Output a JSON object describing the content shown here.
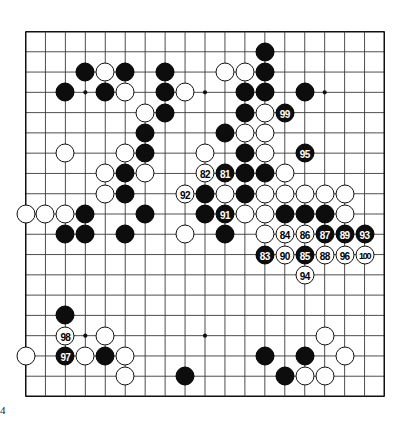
{
  "figure": {
    "kind": "go-board-diagram",
    "board_size": 19,
    "page_number": "4",
    "colors": {
      "black_stone": "#0d0d0d",
      "white_stone": "#ffffff",
      "grid_line": "#3a3a3a",
      "border": "#111111",
      "background": "#ffffff"
    },
    "star_points": [
      [
        4,
        4
      ],
      [
        10,
        4
      ],
      [
        16,
        4
      ],
      [
        4,
        10
      ],
      [
        10,
        10
      ],
      [
        16,
        10
      ],
      [
        4,
        16
      ],
      [
        10,
        16
      ],
      [
        16,
        16
      ]
    ]
  },
  "stones": [
    {
      "color": "black",
      "col": 13,
      "row": 2,
      "label": ""
    },
    {
      "color": "white",
      "col": 11,
      "row": 3,
      "label": ""
    },
    {
      "color": "white",
      "col": 12,
      "row": 3,
      "label": ""
    },
    {
      "color": "black",
      "col": 13,
      "row": 3,
      "label": ""
    },
    {
      "color": "black",
      "col": 4,
      "row": 3,
      "label": ""
    },
    {
      "color": "white",
      "col": 5,
      "row": 3,
      "label": ""
    },
    {
      "color": "black",
      "col": 6,
      "row": 3,
      "label": ""
    },
    {
      "color": "black",
      "col": 8,
      "row": 3,
      "label": ""
    },
    {
      "color": "black",
      "col": 3,
      "row": 4,
      "label": ""
    },
    {
      "color": "black",
      "col": 5,
      "row": 4,
      "label": ""
    },
    {
      "color": "white",
      "col": 6,
      "row": 4,
      "label": ""
    },
    {
      "color": "black",
      "col": 8,
      "row": 4,
      "label": ""
    },
    {
      "color": "white",
      "col": 9,
      "row": 4,
      "label": ""
    },
    {
      "color": "black",
      "col": 12,
      "row": 4,
      "label": ""
    },
    {
      "color": "black",
      "col": 13,
      "row": 4,
      "label": ""
    },
    {
      "color": "black",
      "col": 15,
      "row": 4,
      "label": ""
    },
    {
      "color": "white",
      "col": 7,
      "row": 5,
      "label": ""
    },
    {
      "color": "black",
      "col": 8,
      "row": 5,
      "label": ""
    },
    {
      "color": "black",
      "col": 12,
      "row": 5,
      "label": ""
    },
    {
      "color": "white",
      "col": 13,
      "row": 5,
      "label": ""
    },
    {
      "color": "black",
      "col": 14,
      "row": 5,
      "label": "99"
    },
    {
      "color": "black",
      "col": 7,
      "row": 6,
      "label": ""
    },
    {
      "color": "black",
      "col": 11,
      "row": 6,
      "label": ""
    },
    {
      "color": "white",
      "col": 12,
      "row": 6,
      "label": ""
    },
    {
      "color": "white",
      "col": 13,
      "row": 6,
      "label": ""
    },
    {
      "color": "white",
      "col": 3,
      "row": 7,
      "label": ""
    },
    {
      "color": "white",
      "col": 6,
      "row": 7,
      "label": ""
    },
    {
      "color": "black",
      "col": 7,
      "row": 7,
      "label": ""
    },
    {
      "color": "white",
      "col": 10,
      "row": 7,
      "label": ""
    },
    {
      "color": "black",
      "col": 12,
      "row": 7,
      "label": ""
    },
    {
      "color": "white",
      "col": 13,
      "row": 7,
      "label": ""
    },
    {
      "color": "black",
      "col": 15,
      "row": 7,
      "label": "95"
    },
    {
      "color": "white",
      "col": 5,
      "row": 8,
      "label": ""
    },
    {
      "color": "black",
      "col": 6,
      "row": 8,
      "label": ""
    },
    {
      "color": "white",
      "col": 7,
      "row": 8,
      "label": ""
    },
    {
      "color": "white",
      "col": 10,
      "row": 8,
      "label": "82"
    },
    {
      "color": "black",
      "col": 11,
      "row": 8,
      "label": "81"
    },
    {
      "color": "black",
      "col": 12,
      "row": 8,
      "label": ""
    },
    {
      "color": "black",
      "col": 13,
      "row": 8,
      "label": ""
    },
    {
      "color": "white",
      "col": 14,
      "row": 8,
      "label": ""
    },
    {
      "color": "white",
      "col": 5,
      "row": 9,
      "label": ""
    },
    {
      "color": "black",
      "col": 6,
      "row": 9,
      "label": ""
    },
    {
      "color": "white",
      "col": 9,
      "row": 9,
      "label": "92"
    },
    {
      "color": "black",
      "col": 10,
      "row": 9,
      "label": ""
    },
    {
      "color": "white",
      "col": 11,
      "row": 9,
      "label": ""
    },
    {
      "color": "black",
      "col": 12,
      "row": 9,
      "label": ""
    },
    {
      "color": "white",
      "col": 13,
      "row": 9,
      "label": ""
    },
    {
      "color": "white",
      "col": 14,
      "row": 9,
      "label": ""
    },
    {
      "color": "white",
      "col": 15,
      "row": 9,
      "label": ""
    },
    {
      "color": "white",
      "col": 16,
      "row": 9,
      "label": ""
    },
    {
      "color": "white",
      "col": 17,
      "row": 9,
      "label": ""
    },
    {
      "color": "white",
      "col": 1,
      "row": 10,
      "label": ""
    },
    {
      "color": "white",
      "col": 2,
      "row": 10,
      "label": ""
    },
    {
      "color": "white",
      "col": 3,
      "row": 10,
      "label": ""
    },
    {
      "color": "black",
      "col": 4,
      "row": 10,
      "label": ""
    },
    {
      "color": "black",
      "col": 7,
      "row": 10,
      "label": ""
    },
    {
      "color": "black",
      "col": 10,
      "row": 10,
      "label": ""
    },
    {
      "color": "black",
      "col": 11,
      "row": 10,
      "label": "91"
    },
    {
      "color": "white",
      "col": 12,
      "row": 10,
      "label": ""
    },
    {
      "color": "white",
      "col": 13,
      "row": 10,
      "label": ""
    },
    {
      "color": "black",
      "col": 14,
      "row": 10,
      "label": ""
    },
    {
      "color": "black",
      "col": 15,
      "row": 10,
      "label": ""
    },
    {
      "color": "black",
      "col": 16,
      "row": 10,
      "label": ""
    },
    {
      "color": "white",
      "col": 17,
      "row": 10,
      "label": ""
    },
    {
      "color": "black",
      "col": 3,
      "row": 11,
      "label": ""
    },
    {
      "color": "black",
      "col": 4,
      "row": 11,
      "label": ""
    },
    {
      "color": "black",
      "col": 6,
      "row": 11,
      "label": ""
    },
    {
      "color": "white",
      "col": 9,
      "row": 11,
      "label": ""
    },
    {
      "color": "black",
      "col": 11,
      "row": 11,
      "label": ""
    },
    {
      "color": "white",
      "col": 13,
      "row": 11,
      "label": ""
    },
    {
      "color": "white",
      "col": 14,
      "row": 11,
      "label": "84"
    },
    {
      "color": "white",
      "col": 15,
      "row": 11,
      "label": "86"
    },
    {
      "color": "black",
      "col": 16,
      "row": 11,
      "label": "87"
    },
    {
      "color": "black",
      "col": 17,
      "row": 11,
      "label": "89"
    },
    {
      "color": "black",
      "col": 18,
      "row": 11,
      "label": "93"
    },
    {
      "color": "black",
      "col": 13,
      "row": 12,
      "label": "83"
    },
    {
      "color": "white",
      "col": 14,
      "row": 12,
      "label": "90"
    },
    {
      "color": "black",
      "col": 15,
      "row": 12,
      "label": "85"
    },
    {
      "color": "white",
      "col": 16,
      "row": 12,
      "label": "88"
    },
    {
      "color": "white",
      "col": 17,
      "row": 12,
      "label": "96"
    },
    {
      "color": "white",
      "col": 18,
      "row": 12,
      "label": "100"
    },
    {
      "color": "white",
      "col": 15,
      "row": 13,
      "label": "94"
    },
    {
      "color": "black",
      "col": 3,
      "row": 15,
      "label": ""
    },
    {
      "color": "white",
      "col": 3,
      "row": 16,
      "label": "98"
    },
    {
      "color": "white",
      "col": 5,
      "row": 16,
      "label": ""
    },
    {
      "color": "white",
      "col": 16,
      "row": 16,
      "label": ""
    },
    {
      "color": "white",
      "col": 1,
      "row": 17,
      "label": ""
    },
    {
      "color": "black",
      "col": 3,
      "row": 17,
      "label": "97"
    },
    {
      "color": "white",
      "col": 4,
      "row": 17,
      "label": ""
    },
    {
      "color": "black",
      "col": 5,
      "row": 17,
      "label": ""
    },
    {
      "color": "white",
      "col": 6,
      "row": 17,
      "label": ""
    },
    {
      "color": "black",
      "col": 13,
      "row": 17,
      "label": ""
    },
    {
      "color": "black",
      "col": 15,
      "row": 17,
      "label": ""
    },
    {
      "color": "white",
      "col": 17,
      "row": 17,
      "label": ""
    },
    {
      "color": "white",
      "col": 6,
      "row": 18,
      "label": ""
    },
    {
      "color": "black",
      "col": 9,
      "row": 18,
      "label": ""
    },
    {
      "color": "black",
      "col": 14,
      "row": 18,
      "label": ""
    },
    {
      "color": "white",
      "col": 15,
      "row": 18,
      "label": ""
    },
    {
      "color": "white",
      "col": 16,
      "row": 18,
      "label": ""
    }
  ],
  "move_labels": [
    "81",
    "82",
    "83",
    "84",
    "85",
    "86",
    "87",
    "88",
    "89",
    "90",
    "91",
    "92",
    "93",
    "94",
    "95",
    "96",
    "97",
    "98",
    "99",
    "100"
  ]
}
